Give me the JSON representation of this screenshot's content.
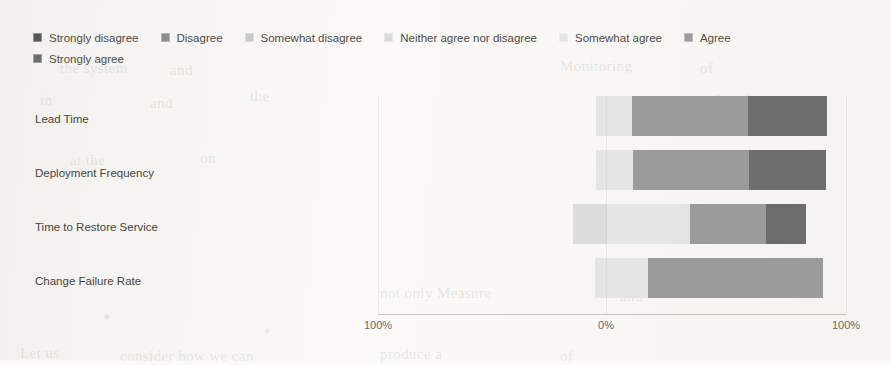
{
  "chart_data": {
    "type": "bar",
    "subtype": "diverging-stacked-likert",
    "title": "",
    "xlabel": "",
    "ylabel": "",
    "orientation": "horizontal",
    "grid": false,
    "legend_position": "top-left",
    "axis": {
      "ticks": [
        {
          "label": "100%",
          "x_px": 378,
          "value": -100
        },
        {
          "label": "0%",
          "x_px": 606,
          "value": 0
        },
        {
          "label": "100%",
          "x_px": 846,
          "value": 100
        }
      ],
      "zero_x_px": 606,
      "px_per_percent": 2.4,
      "xlim": [
        -100,
        100
      ]
    },
    "categories": [
      "Lead Time",
      "Deployment Frequency",
      "Time to Restore Service",
      "Change Failure Rate"
    ],
    "series": [
      {
        "name": "Strongly disagree",
        "color": "#585857",
        "values": [
          0,
          0,
          0,
          0
        ]
      },
      {
        "name": "Disagree",
        "color": "#8d8d8c",
        "values": [
          0,
          0,
          0,
          0
        ]
      },
      {
        "name": "Somewhat disagree",
        "color": "#c9c9c8",
        "values": [
          0,
          0,
          0,
          0
        ]
      },
      {
        "name": "Neither agree nor disagree",
        "color": "#dcdcdb",
        "values": [
          0,
          0,
          14,
          0
        ]
      },
      {
        "name": "Somewhat agree",
        "color": "#e4e4e3",
        "values": [
          15,
          15,
          35,
          22
        ]
      },
      {
        "name": "Agree",
        "color": "#9b9b9a",
        "values": [
          48,
          48,
          32,
          73
        ]
      },
      {
        "name": "Strongly agree",
        "color": "#6d6d6c",
        "values": [
          33,
          32,
          17,
          0
        ]
      }
    ],
    "bars_px": [
      {
        "category": "Lead Time",
        "segments": [
          {
            "series": "Somewhat agree",
            "x0": 596,
            "x1": 632,
            "color": "#e4e4e3"
          },
          {
            "series": "Agree",
            "x0": 632,
            "x1": 748,
            "color": "#9b9b9a"
          },
          {
            "series": "Strongly agree",
            "x0": 748,
            "x1": 827,
            "color": "#6d6d6c"
          }
        ]
      },
      {
        "category": "Deployment Frequency",
        "segments": [
          {
            "series": "Somewhat agree",
            "x0": 596,
            "x1": 633,
            "color": "#e4e4e3"
          },
          {
            "series": "Agree",
            "x0": 633,
            "x1": 749,
            "color": "#9b9b9a"
          },
          {
            "series": "Strongly agree",
            "x0": 749,
            "x1": 826,
            "color": "#6d6d6c"
          }
        ]
      },
      {
        "category": "Time to Restore Service",
        "segments": [
          {
            "series": "Neither agree nor disagree",
            "x0": 573,
            "x1": 607,
            "color": "#dcdcdb"
          },
          {
            "series": "Somewhat agree",
            "x0": 607,
            "x1": 690,
            "color": "#e4e4e3"
          },
          {
            "series": "Agree",
            "x0": 690,
            "x1": 766,
            "color": "#9b9b9a"
          },
          {
            "series": "Strongly agree",
            "x0": 766,
            "x1": 806,
            "color": "#6d6d6c"
          }
        ]
      },
      {
        "category": "Change Failure Rate",
        "segments": [
          {
            "series": "Somewhat agree",
            "x0": 595,
            "x1": 648,
            "color": "#e4e4e3"
          },
          {
            "series": "Agree",
            "x0": 648,
            "x1": 823,
            "color": "#9b9b9a"
          }
        ]
      }
    ]
  },
  "legend": {
    "rows": [
      [
        {
          "label": "Strongly disagree",
          "color": "#585857"
        },
        {
          "label": "Disagree",
          "color": "#8d8d8c"
        },
        {
          "label": "Somewhat disagree",
          "color": "#c9c9c8"
        },
        {
          "label": "Neither agree nor disagree",
          "color": "#dcdcdb"
        },
        {
          "label": "Somewhat agree",
          "color": "#e4e4e3"
        },
        {
          "label": "Agree",
          "color": "#9b9b9a"
        }
      ],
      [
        {
          "label": "Strongly agree",
          "color": "#6d6d6c"
        }
      ]
    ]
  },
  "background_text": [
    {
      "text": "the system",
      "x": 60,
      "y": 60
    },
    {
      "text": "and",
      "x": 170,
      "y": 62
    },
    {
      "text": "Monitoring",
      "x": 560,
      "y": 58
    },
    {
      "text": "of",
      "x": 700,
      "y": 60
    },
    {
      "text": "in",
      "x": 40,
      "y": 92
    },
    {
      "text": "and",
      "x": 150,
      "y": 95
    },
    {
      "text": "the",
      "x": 250,
      "y": 88
    },
    {
      "text": "results of",
      "x": 690,
      "y": 92
    },
    {
      "text": "at the",
      "x": 70,
      "y": 152
    },
    {
      "text": "on",
      "x": 200,
      "y": 150
    },
    {
      "text": "not only Measure",
      "x": 380,
      "y": 285
    },
    {
      "text": "and",
      "x": 620,
      "y": 288
    },
    {
      "text": "Let us",
      "x": 20,
      "y": 345
    },
    {
      "text": "consider how we can",
      "x": 120,
      "y": 348
    },
    {
      "text": "produce a",
      "x": 380,
      "y": 346
    },
    {
      "text": "of",
      "x": 560,
      "y": 348
    }
  ]
}
